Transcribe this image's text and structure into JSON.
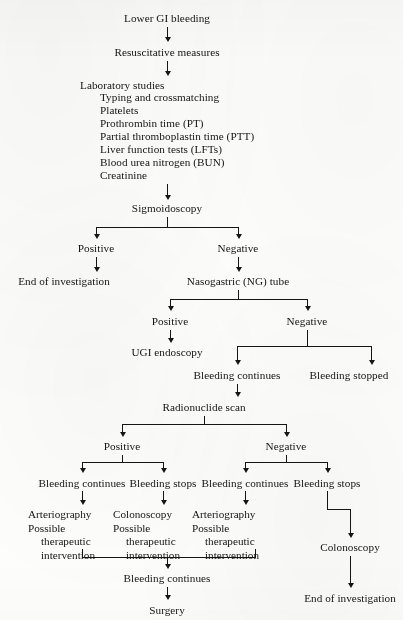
{
  "page": {
    "running_head": "",
    "background_color": "#fdfdfc",
    "ink_color": "#151515"
  },
  "chart_data": {
    "type": "diagram",
    "orientation": "top-to-bottom"
  },
  "nodes": {
    "lower_gi_bleeding": "Lower GI bleeding",
    "resuscitative_measures": "Resuscitative measures",
    "laboratory_studies": "Laboratory studies",
    "lab_items": [
      "Typing and crossmatching",
      "Platelets",
      "Prothrombin time (PT)",
      "Partial thromboplastin time (PTT)",
      "Liver function tests (LFTs)",
      "Blood urea nitrogen (BUN)",
      "Creatinine"
    ],
    "sigmoidoscopy": "Sigmoidoscopy",
    "sig_positive": "Positive",
    "sig_negative": "Negative",
    "end_of_investigation_left": "End of investigation",
    "ng_tube": "Nasogastric (NG) tube",
    "ng_positive": "Positive",
    "ng_negative": "Negative",
    "ugi_endoscopy": "UGI endoscopy",
    "bleeding_continues_1": "Bleeding continues",
    "bleeding_stopped": "Bleeding stopped",
    "radionuclide_scan": "Radionuclide scan",
    "radio_positive": "Positive",
    "radio_negative": "Negative",
    "pos_bleeding_continues": "Bleeding continues",
    "pos_bleeding_stops": "Bleeding stops",
    "neg_bleeding_continues": "Bleeding continues",
    "neg_bleeding_stops": "Bleeding stops",
    "arteriography_block_1": {
      "line1": "Arteriography",
      "line2": "Possible",
      "line3": "therapeutic",
      "line4": "intervention"
    },
    "colonoscopy_block": {
      "line1": "Colonoscopy",
      "line2": "Possible",
      "line3": "therapeutic",
      "line4": "intervention"
    },
    "arteriography_block_2": {
      "line1": "Arteriography",
      "line2": "Possible",
      "line3": "therapeutic",
      "line4": "intervention"
    },
    "colonoscopy_right": "Colonoscopy",
    "bleeding_continues_final": "Bleeding continues",
    "surgery": "Surgery",
    "end_of_investigation_right": "End of investigation"
  }
}
